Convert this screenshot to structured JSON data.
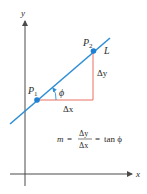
{
  "diagram": {
    "type": "slope-of-line",
    "colors": {
      "axis": "#4a4a4a",
      "line": "#2f8fd6",
      "point": "#1f7fd0",
      "triangle": "#e87060",
      "text": "#2a2a2a"
    },
    "axes": {
      "x_label": "x",
      "y_label": "y"
    },
    "line_label": "L",
    "points": [
      {
        "label": "P",
        "sub": "1"
      },
      {
        "label": "P",
        "sub": "2"
      }
    ],
    "angle_label": "ϕ",
    "delta_x_label": "Δx",
    "delta_y_label": "Δy",
    "formula": {
      "lhs": "m",
      "eq1": "=",
      "numerator": "Δy",
      "denominator": "Δx",
      "eq2": "=",
      "rhs": "tan ϕ"
    }
  }
}
